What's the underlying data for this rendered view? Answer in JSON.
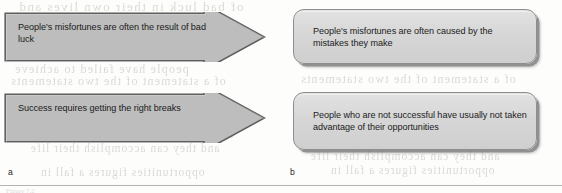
{
  "figure": {
    "panels": [
      {
        "id": "a",
        "label": "a",
        "style": "arrow",
        "items": [
          {
            "text": "People's misfortunes are often the result of bad luck"
          },
          {
            "text": "Success requires getting the right breaks"
          }
        ]
      },
      {
        "id": "b",
        "label": "b",
        "style": "rounded-box",
        "items": [
          {
            "text": "People's misfortunes are often caused by the mistakes they make"
          },
          {
            "text": "People who are not successful have usually not taken advantage of their opportunities"
          }
        ]
      }
    ],
    "colors": {
      "arrow_fill": "#bdbdbd",
      "arrow_stroke": "#5f5f5f",
      "box_fill": "#d8d8d8",
      "box_stroke": "#8e8e8e",
      "text": "#1b1b1b",
      "rule": "#b3b3b3",
      "page_background": "#fdfdfc"
    },
    "scan_artifacts": {
      "bleed_lines": [
        "of bad luck in their own lives and",
        "people have failed to achieve",
        "of a statement of the two statements",
        "moral by which people can actually",
        "attitude is likely acquired in childhood",
        "and they can accomplish their life",
        "opportunities figures a fall in"
      ],
      "caption_remnant": "Figure 7.2"
    }
  }
}
